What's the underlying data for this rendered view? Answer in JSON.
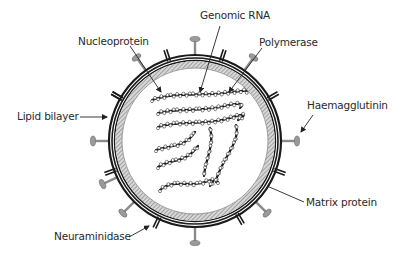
{
  "diagram": {
    "labels": {
      "genomic_rna": "Genomic RNA",
      "nucleoprotein": "Nucleoprotein",
      "polymerase": "Polymerase",
      "lipid_bilayer": "Lipid bilayer",
      "haemagglutinin": "Haemagglutinin",
      "matrix_protein": "Matrix protein",
      "neuraminidase": "Neuraminidase"
    },
    "colors": {
      "membrane": "#1a1a1a",
      "matrix_hatch": "#9a9a9a",
      "spike": "#8a8a8a",
      "text": "#2a2a2a",
      "background": "#ffffff"
    }
  }
}
